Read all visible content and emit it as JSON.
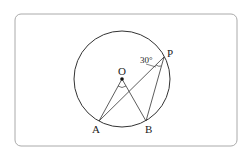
{
  "diagram": {
    "labels": {
      "O": "O",
      "A": "A",
      "B": "B",
      "P": "P",
      "angle": "30°"
    },
    "colors": {
      "stroke": "#333333",
      "frame": "#aaaaaa",
      "background": "#ffffff"
    }
  }
}
